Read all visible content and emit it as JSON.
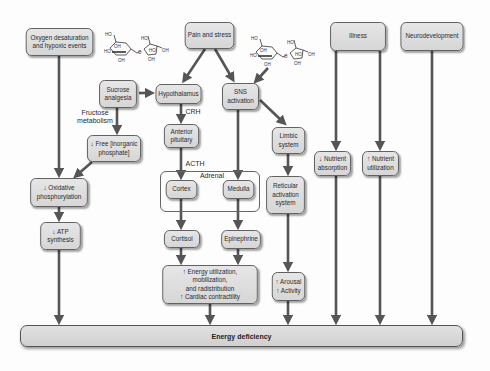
{
  "diagram": {
    "nodes": {
      "oxygen": "Oxygen desaturation\nand hypoxic events",
      "pain": "Pain and stress",
      "illness": "Illness",
      "neuro": "Neurodevelopment",
      "sucrose": "Sucrose\nanalgesia",
      "hypothalamus": "Hypothalamus",
      "sns": "SNS\nactivation",
      "pituitary": "Anterior\npituitary",
      "limbic": "Limbic\nsystem",
      "phosphate": "↓ Free [inorganic\nphosphate]",
      "oxphos": "↓ Oxidative\nphosphorylation",
      "cortex": "Cortex",
      "medulla": "Medulla",
      "reticular": "Reticular\nactivation\nsystem",
      "nutrient_abs": "↓ Nutrient\nabsorption",
      "nutrient_util": "↑ Nutrient\nutilization",
      "atp": "↓ ATP\nsynthesis",
      "cortisol": "Cortisol",
      "epinephrine": "Epinephrine",
      "energy_util": "↑ Energy utilization, mobilization,\nand radistribution\n↑ Cardiac contractility",
      "arousal": "↑ Arousal\n↑ Activity",
      "deficiency": "Energy deficiency"
    },
    "labels": {
      "fructose": "Fructose\nmetabolism",
      "crh": "CRH",
      "acth": "ACTH",
      "adrenal": "Adrenal"
    },
    "molecule_labels": {
      "ho": "HO",
      "oh": "OH",
      "o": "O"
    },
    "colors": {
      "box_fill": "#dcdcdc",
      "box_border": "#5a5a5a",
      "arrow": "#555555",
      "background": "#fdfdfd"
    }
  }
}
